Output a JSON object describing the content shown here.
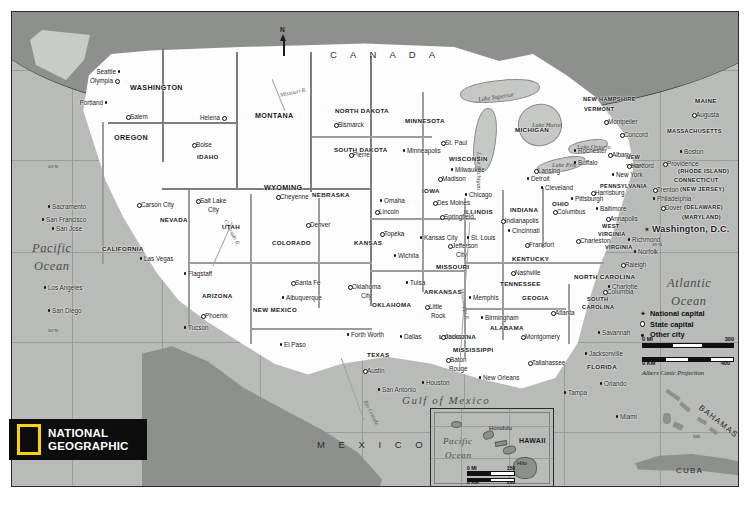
{
  "map": {
    "title": "United States",
    "publisher": "National Geographic",
    "logo": {
      "line1": "NATIONAL",
      "line2": "GEOGRAPHIC",
      "accent_color": "#ffd200"
    },
    "projection": "Albers Conic Projection",
    "north_arrow": "N"
  },
  "legend": {
    "items": [
      {
        "symbol": "star",
        "label": "National capital"
      },
      {
        "symbol": "circle",
        "label": "State capital"
      },
      {
        "symbol": "dot",
        "label": "Other city"
      }
    ]
  },
  "scale_main": {
    "mi_label": "0 MI",
    "mi_max": "300",
    "km_label": "0 KM",
    "km_max": "400"
  },
  "scale_inset": {
    "mi_label": "0 MI",
    "mi_max": "150",
    "km_label": "0 KM",
    "km_max": "200"
  },
  "countries": [
    {
      "name": "C A N A D A",
      "x": 318,
      "y": 38
    },
    {
      "name": "M E X I C O",
      "x": 305,
      "y": 428
    },
    {
      "name": "CUBA",
      "x": 664,
      "y": 455
    },
    {
      "name": "BAHAMAS",
      "x": 690,
      "y": 392
    }
  ],
  "oceans": [
    {
      "name": "Pacific",
      "x": 20,
      "y": 230
    },
    {
      "name": "Ocean",
      "x": 22,
      "y": 248
    },
    {
      "name": "Atlantic",
      "x": 655,
      "y": 265
    },
    {
      "name": "Ocean",
      "x": 659,
      "y": 283
    },
    {
      "name": "Gulf of Mexico",
      "x": 390,
      "y": 383
    }
  ],
  "lakes": [
    {
      "name": "Lake Superior",
      "x": 466,
      "y": 82
    },
    {
      "name": "Lake Michigan",
      "x": 470,
      "y": 140
    },
    {
      "name": "Lake Huron",
      "x": 520,
      "y": 110
    },
    {
      "name": "Lake Erie",
      "x": 540,
      "y": 150
    },
    {
      "name": "Lake Ontario",
      "x": 565,
      "y": 132
    }
  ],
  "rivers": [
    {
      "name": "Missouri R.",
      "x": 268,
      "y": 78
    },
    {
      "name": "Colorado R.",
      "x": 205,
      "y": 218
    },
    {
      "name": "Rio Grande",
      "x": 345,
      "y": 398
    },
    {
      "name": "Mississippi R.",
      "x": 452,
      "y": 276
    }
  ],
  "inset": {
    "name": "HAWAII",
    "ocean": [
      "Pacific",
      "Ocean"
    ],
    "cities": [
      "Honolulu",
      "Hilo"
    ]
  },
  "states": [
    {
      "name": "WASHINGTON",
      "x": 118,
      "y": 72,
      "size": "state"
    },
    {
      "name": "OREGON",
      "x": 102,
      "y": 122,
      "size": "state"
    },
    {
      "name": "IDAHO",
      "x": 185,
      "y": 142,
      "size": "state sm"
    },
    {
      "name": "MONTANA",
      "x": 243,
      "y": 100,
      "size": "state"
    },
    {
      "name": "NORTH DAKOTA",
      "x": 323,
      "y": 96,
      "size": "state sm"
    },
    {
      "name": "SOUTH DAKOTA",
      "x": 322,
      "y": 135,
      "size": "state sm"
    },
    {
      "name": "MINNESOTA",
      "x": 393,
      "y": 106,
      "size": "state sm"
    },
    {
      "name": "WISCONSIN",
      "x": 437,
      "y": 144,
      "size": "state sm"
    },
    {
      "name": "MICHIGAN",
      "x": 503,
      "y": 115,
      "size": "state sm"
    },
    {
      "name": "WYOMING",
      "x": 252,
      "y": 172,
      "size": "state"
    },
    {
      "name": "NEBRASKA",
      "x": 300,
      "y": 180,
      "size": "state sm"
    },
    {
      "name": "IOWA",
      "x": 410,
      "y": 176,
      "size": "state sm"
    },
    {
      "name": "ILLINOIS",
      "x": 452,
      "y": 197,
      "size": "state sm"
    },
    {
      "name": "INDIANA",
      "x": 498,
      "y": 195,
      "size": "state sm"
    },
    {
      "name": "OHIO",
      "x": 540,
      "y": 189,
      "size": "state sm"
    },
    {
      "name": "NEVADA",
      "x": 148,
      "y": 205,
      "size": "state sm"
    },
    {
      "name": "UTAH",
      "x": 210,
      "y": 212,
      "size": "state sm"
    },
    {
      "name": "COLORADO",
      "x": 260,
      "y": 228,
      "size": "state sm"
    },
    {
      "name": "KANSAS",
      "x": 342,
      "y": 228,
      "size": "state sm"
    },
    {
      "name": "MISSOURI",
      "x": 424,
      "y": 252,
      "size": "state sm"
    },
    {
      "name": "KENTUCKY",
      "x": 500,
      "y": 244,
      "size": "state sm"
    },
    {
      "name": "WEST",
      "x": 590,
      "y": 212,
      "size": "state xs"
    },
    {
      "name": "VIRGINIA",
      "x": 586,
      "y": 220,
      "size": "state xs"
    },
    {
      "name": "VIRGINIA",
      "x": 593,
      "y": 233,
      "size": "state xs"
    },
    {
      "name": "CALIFORNIA",
      "x": 90,
      "y": 234,
      "size": "state sm"
    },
    {
      "name": "ARIZONA",
      "x": 190,
      "y": 281,
      "size": "state sm"
    },
    {
      "name": "NEW MEXICO",
      "x": 241,
      "y": 295,
      "size": "state sm"
    },
    {
      "name": "OKLAHOMA",
      "x": 360,
      "y": 290,
      "size": "state sm"
    },
    {
      "name": "ARKANSAS",
      "x": 412,
      "y": 277,
      "size": "state sm"
    },
    {
      "name": "TENNESSEE",
      "x": 488,
      "y": 269,
      "size": "state sm"
    },
    {
      "name": "NORTH CAROLINA",
      "x": 562,
      "y": 262,
      "size": "state sm"
    },
    {
      "name": "SOUTH",
      "x": 575,
      "y": 285,
      "size": "state xs"
    },
    {
      "name": "CAROLINA",
      "x": 570,
      "y": 293,
      "size": "state xs"
    },
    {
      "name": "GEOGIA",
      "x": 510,
      "y": 283,
      "size": "state sm"
    },
    {
      "name": "ALABAMA",
      "x": 478,
      "y": 313,
      "size": "state sm"
    },
    {
      "name": "MISSISSIPPI",
      "x": 441,
      "y": 335,
      "size": "state sm"
    },
    {
      "name": "LOUISIANA",
      "x": 427,
      "y": 322,
      "size": "state sm"
    },
    {
      "name": "TEXAS",
      "x": 355,
      "y": 340,
      "size": "state sm"
    },
    {
      "name": "FLORIDA",
      "x": 575,
      "y": 352,
      "size": "state sm"
    },
    {
      "name": "PENNSYLVANIA",
      "x": 588,
      "y": 172,
      "size": "state xs"
    },
    {
      "name": "NEW",
      "x": 614,
      "y": 143,
      "size": "state xs"
    },
    {
      "name": "YORK",
      "x": 614,
      "y": 152,
      "size": "state xs"
    },
    {
      "name": "MAINE",
      "x": 683,
      "y": 86,
      "size": "state sm"
    },
    {
      "name": "NEW HAMPSHIRE",
      "x": 571,
      "y": 85,
      "size": "state xs"
    },
    {
      "name": "VERMONT",
      "x": 572,
      "y": 95,
      "size": "state xs"
    },
    {
      "name": "MASSACHUSETTS",
      "x": 655,
      "y": 117,
      "size": "state xs"
    },
    {
      "name": "(RHODE ISLAND)",
      "x": 666,
      "y": 157,
      "size": "state xs"
    },
    {
      "name": "CONNECTICUT",
      "x": 662,
      "y": 166,
      "size": "state xs"
    },
    {
      "name": "(NEW JERSEY)",
      "x": 668,
      "y": 175,
      "size": "state xs"
    },
    {
      "name": "(DELAWARE)",
      "x": 672,
      "y": 193,
      "size": "state xs"
    },
    {
      "name": "(MARYLAND)",
      "x": 670,
      "y": 203,
      "size": "state xs"
    }
  ],
  "cities": [
    {
      "name": "Seattle",
      "x": 104,
      "y": 57,
      "type": "dot",
      "anchor": "right"
    },
    {
      "name": "Olympia",
      "x": 101,
      "y": 66,
      "type": "circle",
      "anchor": "right"
    },
    {
      "name": "Portland",
      "x": 91,
      "y": 88,
      "type": "dot",
      "anchor": "right"
    },
    {
      "name": "Salem",
      "x": 118,
      "y": 102,
      "type": "circle",
      "anchor": "left"
    },
    {
      "name": "Boise",
      "x": 184,
      "y": 130,
      "type": "circle",
      "anchor": "left"
    },
    {
      "name": "Helena",
      "x": 208,
      "y": 103,
      "type": "circle",
      "anchor": "right"
    },
    {
      "name": "Bismarck",
      "x": 326,
      "y": 110,
      "type": "circle",
      "anchor": "left"
    },
    {
      "name": "Pierre",
      "x": 341,
      "y": 140,
      "type": "circle",
      "anchor": "left"
    },
    {
      "name": "St. Paul",
      "x": 433,
      "y": 128,
      "type": "circle",
      "anchor": "left"
    },
    {
      "name": "Minneapolis",
      "x": 395,
      "y": 136,
      "type": "dot",
      "anchor": "left"
    },
    {
      "name": "Madison",
      "x": 430,
      "y": 164,
      "type": "circle",
      "anchor": "left"
    },
    {
      "name": "Milwaukee",
      "x": 443,
      "y": 155,
      "type": "dot",
      "anchor": "left"
    },
    {
      "name": "Lansing",
      "x": 526,
      "y": 156,
      "type": "circle",
      "anchor": "left"
    },
    {
      "name": "Detroit",
      "x": 519,
      "y": 164,
      "type": "dot",
      "anchor": "left"
    },
    {
      "name": "Cleveland",
      "x": 533,
      "y": 173,
      "type": "dot",
      "anchor": "left"
    },
    {
      "name": "Chicago",
      "x": 457,
      "y": 180,
      "type": "dot",
      "anchor": "left"
    },
    {
      "name": "Des Moines",
      "x": 425,
      "y": 188,
      "type": "circle",
      "anchor": "left"
    },
    {
      "name": "Omaha",
      "x": 372,
      "y": 186,
      "type": "dot",
      "anchor": "left"
    },
    {
      "name": "Lincoln",
      "x": 367,
      "y": 197,
      "type": "circle",
      "anchor": "left"
    },
    {
      "name": "Cheyenne",
      "x": 268,
      "y": 182,
      "type": "circle",
      "anchor": "left"
    },
    {
      "name": "Denver",
      "x": 298,
      "y": 210,
      "type": "circle",
      "anchor": "left"
    },
    {
      "name": "Salt Lake",
      "x": 188,
      "y": 186,
      "type": "circle",
      "anchor": "left"
    },
    {
      "name": "City",
      "x": 196,
      "y": 195,
      "type": "none",
      "anchor": "left"
    },
    {
      "name": "Carson City",
      "x": 129,
      "y": 190,
      "type": "circle",
      "anchor": "left"
    },
    {
      "name": "Sacramento",
      "x": 40,
      "y": 192,
      "type": "dot",
      "anchor": "left"
    },
    {
      "name": "San Francisco",
      "x": 34,
      "y": 205,
      "type": "dot",
      "anchor": "left"
    },
    {
      "name": "San Jose",
      "x": 44,
      "y": 214,
      "type": "dot",
      "anchor": "left"
    },
    {
      "name": "Las Vegas",
      "x": 132,
      "y": 244,
      "type": "dot",
      "anchor": "left"
    },
    {
      "name": "Los Angeles",
      "x": 36,
      "y": 273,
      "type": "dot",
      "anchor": "left"
    },
    {
      "name": "San Diego",
      "x": 40,
      "y": 296,
      "type": "dot",
      "anchor": "left"
    },
    {
      "name": "Flagstaff",
      "x": 176,
      "y": 259,
      "type": "dot",
      "anchor": "left"
    },
    {
      "name": "Phoenix",
      "x": 193,
      "y": 301,
      "type": "circle",
      "anchor": "left"
    },
    {
      "name": "Tucson",
      "x": 176,
      "y": 313,
      "type": "dot",
      "anchor": "left"
    },
    {
      "name": "Santa Fe",
      "x": 283,
      "y": 268,
      "type": "circle",
      "anchor": "left"
    },
    {
      "name": "Albuquerque",
      "x": 274,
      "y": 283,
      "type": "dot",
      "anchor": "left"
    },
    {
      "name": "El Paso",
      "x": 272,
      "y": 330,
      "type": "dot",
      "anchor": "left"
    },
    {
      "name": "Topeka",
      "x": 372,
      "y": 219,
      "type": "circle",
      "anchor": "left"
    },
    {
      "name": "Wichita",
      "x": 386,
      "y": 241,
      "type": "dot",
      "anchor": "left"
    },
    {
      "name": "Kansas City",
      "x": 412,
      "y": 223,
      "type": "dot",
      "anchor": "left"
    },
    {
      "name": "Springfield",
      "x": 432,
      "y": 202,
      "type": "circle",
      "anchor": "left"
    },
    {
      "name": "St. Louis",
      "x": 459,
      "y": 223,
      "type": "dot",
      "anchor": "left"
    },
    {
      "name": "Jefferson",
      "x": 440,
      "y": 231,
      "type": "circle",
      "anchor": "left"
    },
    {
      "name": "City",
      "x": 444,
      "y": 240,
      "type": "none",
      "anchor": "left"
    },
    {
      "name": "Indianapolis",
      "x": 493,
      "y": 206,
      "type": "circle",
      "anchor": "left"
    },
    {
      "name": "Cincinnati",
      "x": 500,
      "y": 216,
      "type": "dot",
      "anchor": "left"
    },
    {
      "name": "Columbus",
      "x": 545,
      "y": 197,
      "type": "circle",
      "anchor": "left"
    },
    {
      "name": "Pittsburgh",
      "x": 563,
      "y": 184,
      "type": "dot",
      "anchor": "left"
    },
    {
      "name": "Baltimore",
      "x": 588,
      "y": 194,
      "type": "dot",
      "anchor": "left"
    },
    {
      "name": "Harrisburg",
      "x": 583,
      "y": 178,
      "type": "circle",
      "anchor": "left"
    },
    {
      "name": "Annapolis",
      "x": 598,
      "y": 204,
      "type": "circle",
      "anchor": "left"
    },
    {
      "name": "Frankfort",
      "x": 517,
      "y": 230,
      "type": "circle",
      "anchor": "left"
    },
    {
      "name": "Charleston",
      "x": 568,
      "y": 226,
      "type": "circle",
      "anchor": "left"
    },
    {
      "name": "Richmond",
      "x": 620,
      "y": 225,
      "type": "dot",
      "anchor": "left"
    },
    {
      "name": "Norfolk",
      "x": 626,
      "y": 237,
      "type": "dot",
      "anchor": "left"
    },
    {
      "name": "Raleigh",
      "x": 613,
      "y": 250,
      "type": "circle",
      "anchor": "left"
    },
    {
      "name": "Charlotte",
      "x": 600,
      "y": 272,
      "type": "dot",
      "anchor": "left"
    },
    {
      "name": "Columbia",
      "x": 595,
      "y": 277,
      "type": "circle",
      "anchor": "left"
    },
    {
      "name": "Nashville",
      "x": 503,
      "y": 258,
      "type": "circle",
      "anchor": "left"
    },
    {
      "name": "Memphis",
      "x": 461,
      "y": 283,
      "type": "dot",
      "anchor": "left"
    },
    {
      "name": "Little",
      "x": 417,
      "y": 292,
      "type": "circle",
      "anchor": "left"
    },
    {
      "name": "Rock",
      "x": 419,
      "y": 301,
      "type": "none",
      "anchor": "left"
    },
    {
      "name": "Tulsa",
      "x": 398,
      "y": 268,
      "type": "dot",
      "anchor": "left"
    },
    {
      "name": "Oklahoma",
      "x": 340,
      "y": 272,
      "type": "circle",
      "anchor": "left"
    },
    {
      "name": "City",
      "x": 349,
      "y": 281,
      "type": "none",
      "anchor": "left"
    },
    {
      "name": "Forth Worth",
      "x": 339,
      "y": 320,
      "type": "dot",
      "anchor": "left"
    },
    {
      "name": "Dallas",
      "x": 392,
      "y": 322,
      "type": "dot",
      "anchor": "left"
    },
    {
      "name": "Austin",
      "x": 355,
      "y": 356,
      "type": "circle",
      "anchor": "left"
    },
    {
      "name": "San Antonio",
      "x": 370,
      "y": 375,
      "type": "dot",
      "anchor": "left"
    },
    {
      "name": "Houston",
      "x": 414,
      "y": 368,
      "type": "dot",
      "anchor": "left"
    },
    {
      "name": "Baton",
      "x": 438,
      "y": 345,
      "type": "circle",
      "anchor": "left"
    },
    {
      "name": "Rouge",
      "x": 437,
      "y": 354,
      "type": "none",
      "anchor": "left"
    },
    {
      "name": "New Orleans",
      "x": 471,
      "y": 363,
      "type": "dot",
      "anchor": "left"
    },
    {
      "name": "Jackson",
      "x": 433,
      "y": 322,
      "type": "circle",
      "anchor": "left"
    },
    {
      "name": "Birmingham",
      "x": 473,
      "y": 303,
      "type": "dot",
      "anchor": "left"
    },
    {
      "name": "Montgomery",
      "x": 513,
      "y": 322,
      "type": "circle",
      "anchor": "left"
    },
    {
      "name": "Atlanta",
      "x": 543,
      "y": 298,
      "type": "circle",
      "anchor": "left"
    },
    {
      "name": "Savannah",
      "x": 590,
      "y": 318,
      "type": "dot",
      "anchor": "left"
    },
    {
      "name": "Jacksonville",
      "x": 577,
      "y": 339,
      "type": "dot",
      "anchor": "left"
    },
    {
      "name": "Tallahassee",
      "x": 520,
      "y": 348,
      "type": "circle",
      "anchor": "left"
    },
    {
      "name": "Tampa",
      "x": 556,
      "y": 378,
      "type": "dot",
      "anchor": "left"
    },
    {
      "name": "Orlando",
      "x": 592,
      "y": 369,
      "type": "dot",
      "anchor": "left"
    },
    {
      "name": "Miami",
      "x": 608,
      "y": 402,
      "type": "dot",
      "anchor": "left"
    },
    {
      "name": "Montpelier",
      "x": 596,
      "y": 107,
      "type": "circle",
      "anchor": "left"
    },
    {
      "name": "Concord",
      "x": 612,
      "y": 120,
      "type": "circle",
      "anchor": "left"
    },
    {
      "name": "Augusta",
      "x": 684,
      "y": 100,
      "type": "circle",
      "anchor": "left"
    },
    {
      "name": "Boston",
      "x": 672,
      "y": 137,
      "type": "dot",
      "anchor": "left"
    },
    {
      "name": "Albany",
      "x": 600,
      "y": 140,
      "type": "circle",
      "anchor": "left"
    },
    {
      "name": "Buffalo",
      "x": 566,
      "y": 148,
      "type": "dot",
      "anchor": "left"
    },
    {
      "name": "Rochester",
      "x": 566,
      "y": 136,
      "type": "dot",
      "anchor": "left"
    },
    {
      "name": "Hartford",
      "x": 619,
      "y": 151,
      "type": "circle",
      "anchor": "left"
    },
    {
      "name": "Providence",
      "x": 655,
      "y": 149,
      "type": "circle",
      "anchor": "left"
    },
    {
      "name": "New York",
      "x": 604,
      "y": 160,
      "type": "dot",
      "anchor": "left"
    },
    {
      "name": "Trenton",
      "x": 645,
      "y": 175,
      "type": "circle",
      "anchor": "left"
    },
    {
      "name": "Philadelphia",
      "x": 645,
      "y": 184,
      "type": "dot",
      "anchor": "left"
    },
    {
      "name": "Dover",
      "x": 653,
      "y": 193,
      "type": "circle",
      "anchor": "left"
    },
    {
      "name": "Washington, D.C.",
      "x": 640,
      "y": 213,
      "type": "star",
      "anchor": "left"
    }
  ]
}
